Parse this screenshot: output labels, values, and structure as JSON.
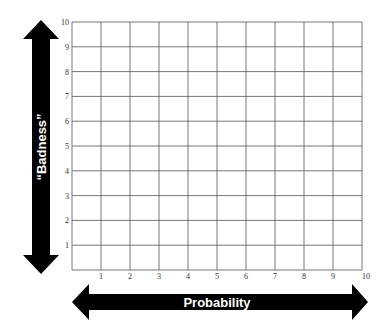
{
  "diagram": {
    "type": "risk-matrix-grid",
    "x_axis": {
      "label": "Probability",
      "ticks": [
        "1",
        "2",
        "3",
        "4",
        "5",
        "6",
        "7",
        "8",
        "9",
        "10"
      ],
      "min": 0,
      "max": 10
    },
    "y_axis": {
      "label": "“Badness”",
      "ticks": [
        "1",
        "2",
        "3",
        "4",
        "5",
        "6",
        "7",
        "8",
        "9",
        "10"
      ],
      "min": 0,
      "max": 10
    },
    "grid": {
      "rows": 10,
      "cols": 10,
      "line_color": "#555555"
    },
    "colors": {
      "arrow": "#000000",
      "arrow_text": "#ffffff",
      "background": "#ffffff"
    }
  }
}
